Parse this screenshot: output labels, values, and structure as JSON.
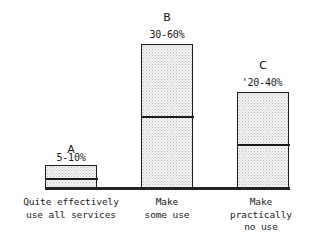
{
  "chart_data": {
    "type": "bar",
    "title": "",
    "subtitle": "",
    "xlabel": "",
    "ylabel": "",
    "grid": false,
    "legend": "none",
    "axis": {
      "y_visible": false,
      "x_visible": true,
      "ylim": [
        0,
        65
      ]
    },
    "series_letters": [
      "A",
      "B",
      "C"
    ],
    "categories": [
      "Quite effectively\nuse all services",
      "Make\nsome use",
      "Make\npractically\nno use"
    ],
    "value_labels": [
      "5-10%",
      "30-60%",
      "'20-40%"
    ],
    "ranges": [
      {
        "letter": "A",
        "low": 5,
        "high": 10
      },
      {
        "letter": "B",
        "low": 30,
        "high": 60
      },
      {
        "letter": "C",
        "low": 20,
        "high": 40
      }
    ],
    "values": [
      10,
      60,
      40
    ],
    "annotations": [
      "Each bar is split by a horizontal rule into a lower segment (lower bound of range) and an upper segment (upper bound of range).",
      "Bars are filled with a light stipple/dot halftone pattern and outlined in black."
    ]
  },
  "bars": [
    {
      "letter": "A",
      "value_label": "5-10%",
      "category": "Quite effectively\nuse all services",
      "geom": {
        "left": 45,
        "width": 52,
        "top": 165,
        "bottom": 189,
        "divider_y": 177
      },
      "letter_pos": {
        "left": 45,
        "top": 144,
        "width": 52
      },
      "value_pos": {
        "left": 37,
        "top": 152,
        "width": 68
      },
      "cat_pos": {
        "left": 8,
        "top": 196,
        "width": 126
      }
    },
    {
      "letter": "B",
      "value_label": "30-60%",
      "category": "Make\nsome use",
      "geom": {
        "left": 141,
        "width": 52,
        "top": 44,
        "bottom": 189,
        "divider_y": 115
      },
      "letter_pos": {
        "left": 141,
        "top": 12,
        "width": 52
      },
      "value_pos": {
        "left": 131,
        "top": 29,
        "width": 72
      },
      "cat_pos": {
        "left": 117,
        "top": 196,
        "width": 100
      }
    },
    {
      "letter": "C",
      "value_label": "'20-40%",
      "category": "Make\npractically\nno use",
      "geom": {
        "left": 237,
        "width": 52,
        "top": 92,
        "bottom": 189,
        "divider_y": 143
      },
      "letter_pos": {
        "left": 237,
        "top": 60,
        "width": 52
      },
      "value_pos": {
        "left": 222,
        "top": 77,
        "width": 80
      },
      "cat_pos": {
        "left": 208,
        "top": 196,
        "width": 106
      }
    }
  ],
  "colors": {
    "background": "#ffffff",
    "ink": "#1a1a1a",
    "bar_outline": "#1c1c1c",
    "bar_fill": "#f4f4f4",
    "bar_stipple": "#bdbdbd",
    "axis": "#222222"
  }
}
